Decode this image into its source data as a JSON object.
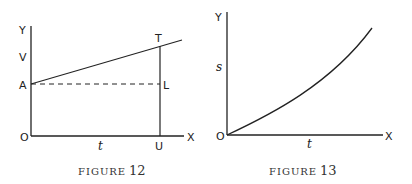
{
  "figures": [
    {
      "id": "figure-12",
      "caption_word": "FIGURE",
      "caption_number": "12",
      "axes": {
        "y_label": "Y",
        "x_label": "X",
        "origin_label": "O"
      },
      "labels": {
        "v": "V",
        "a": "A",
        "t_axis": "t",
        "t_point": "T",
        "l_point": "L",
        "u_point": "U"
      },
      "elements": [
        "straight line from A rising to T and beyond",
        "dashed horizontal line from A to L",
        "vertical line from T through L to U on x-axis"
      ]
    },
    {
      "id": "figure-13",
      "caption_word": "FIGURE",
      "caption_number": "13",
      "axes": {
        "y_label": "Y",
        "x_label": "X",
        "origin_label": "O"
      },
      "labels": {
        "s": "s",
        "t_axis": "t"
      },
      "elements": [
        "upward-curving (parabolic) curve from origin O"
      ]
    }
  ],
  "colors": {
    "ink": "#222222",
    "background": "#ffffff"
  }
}
